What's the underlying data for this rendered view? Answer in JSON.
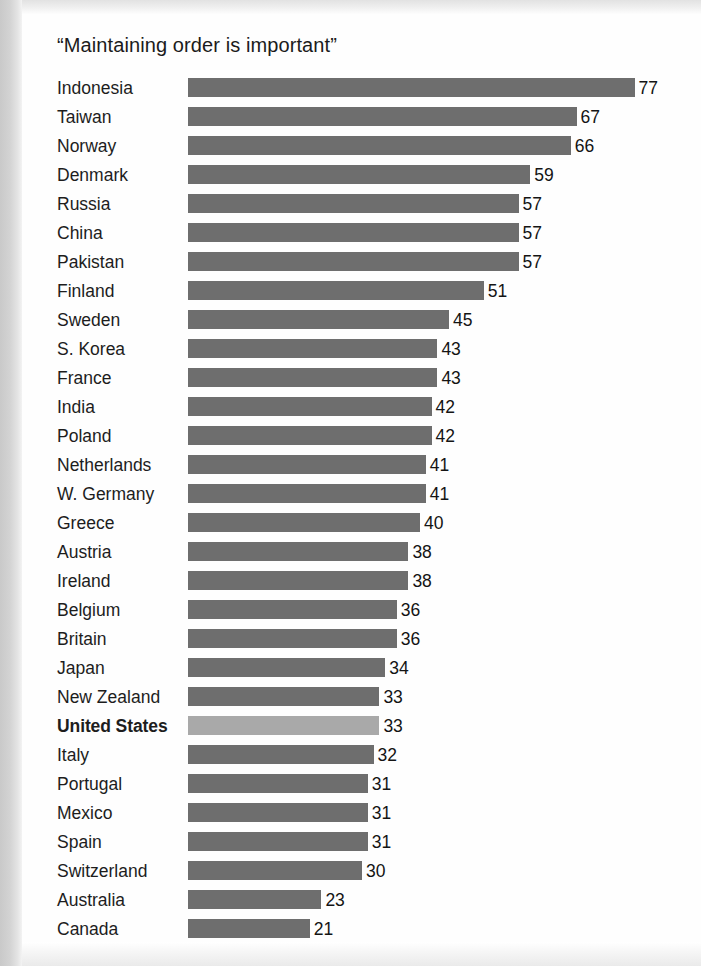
{
  "chart_data": {
    "type": "bar",
    "title": "“Maintaining order is important”",
    "xlabel": "",
    "ylabel": "",
    "orientation": "horizontal",
    "grid": false,
    "legend": "none",
    "xlim": [
      0,
      80
    ],
    "value_suffix": "",
    "highlight_category": "United States",
    "colors": {
      "bar": "#6e6e6e",
      "bar_highlight": "#a9a9a9",
      "text": "#1d1d1d",
      "background": "#fefefe"
    },
    "categories": [
      "Indonesia",
      "Taiwan",
      "Norway",
      "Denmark",
      "Russia",
      "China",
      "Pakistan",
      "Finland",
      "Sweden",
      "S. Korea",
      "France",
      "India",
      "Poland",
      "Netherlands",
      "W. Germany",
      "Greece",
      "Austria",
      "Ireland",
      "Belgium",
      "Britain",
      "Japan",
      "New Zealand",
      "United States",
      "Italy",
      "Portugal",
      "Mexico",
      "Spain",
      "Switzerland",
      "Australia",
      "Canada"
    ],
    "values": [
      77,
      67,
      66,
      59,
      57,
      57,
      57,
      51,
      45,
      43,
      43,
      42,
      42,
      41,
      41,
      40,
      38,
      38,
      36,
      36,
      34,
      33,
      33,
      32,
      31,
      31,
      31,
      30,
      23,
      21
    ],
    "rows": [
      {
        "label": "Indonesia",
        "value": 77,
        "highlight": false
      },
      {
        "label": "Taiwan",
        "value": 67,
        "highlight": false
      },
      {
        "label": "Norway",
        "value": 66,
        "highlight": false
      },
      {
        "label": "Denmark",
        "value": 59,
        "highlight": false
      },
      {
        "label": "Russia",
        "value": 57,
        "highlight": false
      },
      {
        "label": "China",
        "value": 57,
        "highlight": false
      },
      {
        "label": "Pakistan",
        "value": 57,
        "highlight": false
      },
      {
        "label": "Finland",
        "value": 51,
        "highlight": false
      },
      {
        "label": "Sweden",
        "value": 45,
        "highlight": false
      },
      {
        "label": "S. Korea",
        "value": 43,
        "highlight": false
      },
      {
        "label": "France",
        "value": 43,
        "highlight": false
      },
      {
        "label": "India",
        "value": 42,
        "highlight": false
      },
      {
        "label": "Poland",
        "value": 42,
        "highlight": false
      },
      {
        "label": "Netherlands",
        "value": 41,
        "highlight": false
      },
      {
        "label": "W. Germany",
        "value": 41,
        "highlight": false
      },
      {
        "label": "Greece",
        "value": 40,
        "highlight": false
      },
      {
        "label": "Austria",
        "value": 38,
        "highlight": false
      },
      {
        "label": "Ireland",
        "value": 38,
        "highlight": false
      },
      {
        "label": "Belgium",
        "value": 36,
        "highlight": false
      },
      {
        "label": "Britain",
        "value": 36,
        "highlight": false
      },
      {
        "label": "Japan",
        "value": 34,
        "highlight": false
      },
      {
        "label": "New Zealand",
        "value": 33,
        "highlight": false
      },
      {
        "label": "United States",
        "value": 33,
        "highlight": true
      },
      {
        "label": "Italy",
        "value": 32,
        "highlight": false
      },
      {
        "label": "Portugal",
        "value": 31,
        "highlight": false
      },
      {
        "label": "Mexico",
        "value": 31,
        "highlight": false
      },
      {
        "label": "Spain",
        "value": 31,
        "highlight": false
      },
      {
        "label": "Switzerland",
        "value": 30,
        "highlight": false
      },
      {
        "label": "Australia",
        "value": 23,
        "highlight": false
      },
      {
        "label": "Canada",
        "value": 21,
        "highlight": false
      }
    ]
  },
  "render": {
    "px_per_unit": 5.8,
    "value_gap_px": 4
  }
}
